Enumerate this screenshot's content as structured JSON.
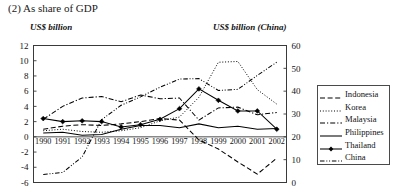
{
  "figure": {
    "title": "(2) As share of GDP",
    "left_axis_label": "US$ billion",
    "right_axis_label": "US$ billion (China)"
  },
  "legend": {
    "position": "right-outside",
    "entries": [
      {
        "label": "Indonesia",
        "style": "dashed",
        "color": "#000000"
      },
      {
        "label": "Korea",
        "style": "dotted",
        "color": "#000000"
      },
      {
        "label": "Malaysia",
        "style": "dashdot",
        "color": "#000000"
      },
      {
        "label": "Philippines",
        "style": "solid",
        "color": "#000000"
      },
      {
        "label": "Thailand",
        "style": "solid-marker",
        "color": "#000000"
      },
      {
        "label": "China",
        "style": "dashdotdot",
        "color": "#000000"
      }
    ]
  },
  "chart_data": {
    "type": "line",
    "title": "(2) As share of GDP",
    "xlabel": "",
    "ylabel": "US$ billion",
    "y2label": "US$ billion (China)",
    "ylim": [
      -6,
      12
    ],
    "y2lim": [
      0,
      60
    ],
    "yticks": [
      -6,
      -4,
      -2,
      0,
      2,
      4,
      6,
      8,
      10,
      12
    ],
    "y2ticks": [
      0,
      10,
      20,
      30,
      40,
      50,
      60
    ],
    "grid": false,
    "legend_position": "right-outside",
    "x": [
      "1990",
      "1991",
      "1992",
      "1993",
      "1994",
      "1995",
      "1996",
      "1997",
      "1998",
      "1999",
      "2000",
      "2001",
      "2002"
    ],
    "categories": [
      "1990",
      "1991",
      "1992",
      "1993",
      "1994",
      "1995",
      "1996",
      "1997",
      "1998",
      "1999",
      "2000",
      "2001",
      "2002"
    ],
    "series": [
      {
        "name": "Indonesia",
        "axis": "left",
        "style": "dashed",
        "values": [
          1.0,
          1.4,
          1.6,
          1.5,
          1.7,
          2.0,
          2.4,
          2.2,
          -0.4,
          -1.6,
          -3.3,
          -4.9,
          -2.8
        ]
      },
      {
        "name": "Korea",
        "axis": "left",
        "style": "dotted",
        "values": [
          0.8,
          1.0,
          0.7,
          0.6,
          0.8,
          1.2,
          2.1,
          2.6,
          5.2,
          9.8,
          9.9,
          6.2,
          4.3
        ]
      },
      {
        "name": "Malaysia",
        "axis": "left",
        "style": "dashdot",
        "values": [
          2.3,
          4.0,
          5.1,
          5.3,
          4.6,
          5.5,
          5.0,
          5.1,
          2.2,
          3.8,
          3.9,
          2.9,
          3.2
        ]
      },
      {
        "name": "Philippines",
        "axis": "left",
        "style": "solid",
        "values": [
          0.5,
          0.6,
          0.2,
          0.3,
          1.0,
          1.5,
          1.5,
          1.2,
          1.7,
          1.2,
          1.4,
          1.0,
          1.1
        ]
      },
      {
        "name": "Thailand",
        "axis": "left",
        "style": "solid-marker",
        "values": [
          2.4,
          2.0,
          2.1,
          2.0,
          1.3,
          1.6,
          2.3,
          3.7,
          6.3,
          4.8,
          3.4,
          3.4,
          1.0
        ]
      },
      {
        "name": "China",
        "axis": "right",
        "style": "dashdotdot",
        "values": [
          3.5,
          4.4,
          11.2,
          27.5,
          33.8,
          37.5,
          41.7,
          45.3,
          45.5,
          40.3,
          40.8,
          46.9,
          52.7
        ]
      }
    ]
  }
}
